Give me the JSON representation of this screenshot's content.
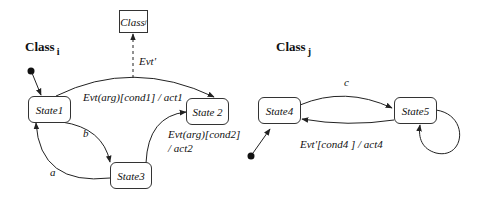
{
  "diagram": {
    "type": "state-machine",
    "colors": {
      "line": "#222222",
      "background": "#ffffff",
      "text": "#111111"
    },
    "class_i": {
      "label": "Class",
      "subscript": "i",
      "states": [
        {
          "id": "state1",
          "label": "State1"
        },
        {
          "id": "state2",
          "label": "State 2"
        },
        {
          "id": "state3",
          "label": "State3"
        }
      ],
      "transitions": [
        {
          "from": "initial",
          "to": "state1",
          "label": ""
        },
        {
          "from": "state1",
          "to": "state2",
          "label": "Evt(arg)[cond1] / act1"
        },
        {
          "from": "state1",
          "to": "state3",
          "label": "b"
        },
        {
          "from": "state3",
          "to": "state1",
          "label": "a"
        },
        {
          "from": "state3",
          "to": "state2",
          "label_line1": "Evt(arg)[cond2]",
          "label_line2": "/ act2"
        }
      ],
      "event_send": {
        "target": "Class_j",
        "label": "Evt'"
      }
    },
    "class_j_box": {
      "label": "Class",
      "subscript": "j"
    },
    "class_j": {
      "label": "Class",
      "subscript": "j",
      "states": [
        {
          "id": "state4",
          "label": "State4"
        },
        {
          "id": "state5",
          "label": "State5"
        }
      ],
      "transitions": [
        {
          "from": "initial",
          "to": "state4",
          "label": ""
        },
        {
          "from": "state4",
          "to": "state5",
          "label": "c"
        },
        {
          "from": "state5",
          "to": "state4",
          "label": "Evt'[cond4 ] / act4"
        },
        {
          "from": "state5",
          "to": "state5",
          "label": ""
        }
      ]
    }
  }
}
